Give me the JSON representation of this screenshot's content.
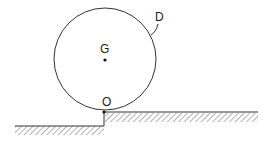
{
  "diagram": {
    "type": "physics-figure",
    "labels": {
      "disk": "D",
      "center": "G",
      "contact": "O"
    },
    "colors": {
      "stroke": "#333333",
      "hatch": "#555555",
      "text": "#1a1a1a",
      "background": "#ffffff"
    }
  }
}
